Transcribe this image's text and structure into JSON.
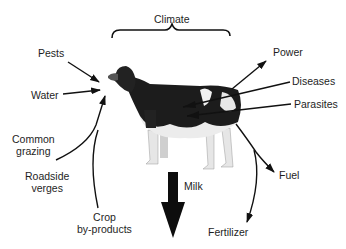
{
  "diagram": {
    "title": "Climate",
    "center": {
      "subject": "dairy cow",
      "icon": "cow-icon"
    },
    "inputs": [
      {
        "id": "pests",
        "label": "Pests"
      },
      {
        "id": "water",
        "label": "Water"
      },
      {
        "id": "common-grazing",
        "label_lines": [
          "Common",
          "grazing"
        ]
      },
      {
        "id": "roadside-verges",
        "label_lines": [
          "Roadside",
          "verges"
        ]
      },
      {
        "id": "crop-byproducts",
        "label_lines": [
          "Crop",
          "by-products"
        ]
      }
    ],
    "outputs": [
      {
        "id": "power",
        "label": "Power"
      },
      {
        "id": "milk",
        "label": "Milk"
      },
      {
        "id": "fuel",
        "label": "Fuel"
      },
      {
        "id": "fertilizer",
        "label": "Fertilizer"
      }
    ],
    "threats": [
      {
        "id": "diseases",
        "label": "Diseases"
      },
      {
        "id": "parasites",
        "label": "Parasites"
      }
    ],
    "colors": {
      "ink": "#111111",
      "cow_dark": "#1c1c1c",
      "cow_light": "#e9e9e9",
      "background": "#ffffff"
    }
  }
}
